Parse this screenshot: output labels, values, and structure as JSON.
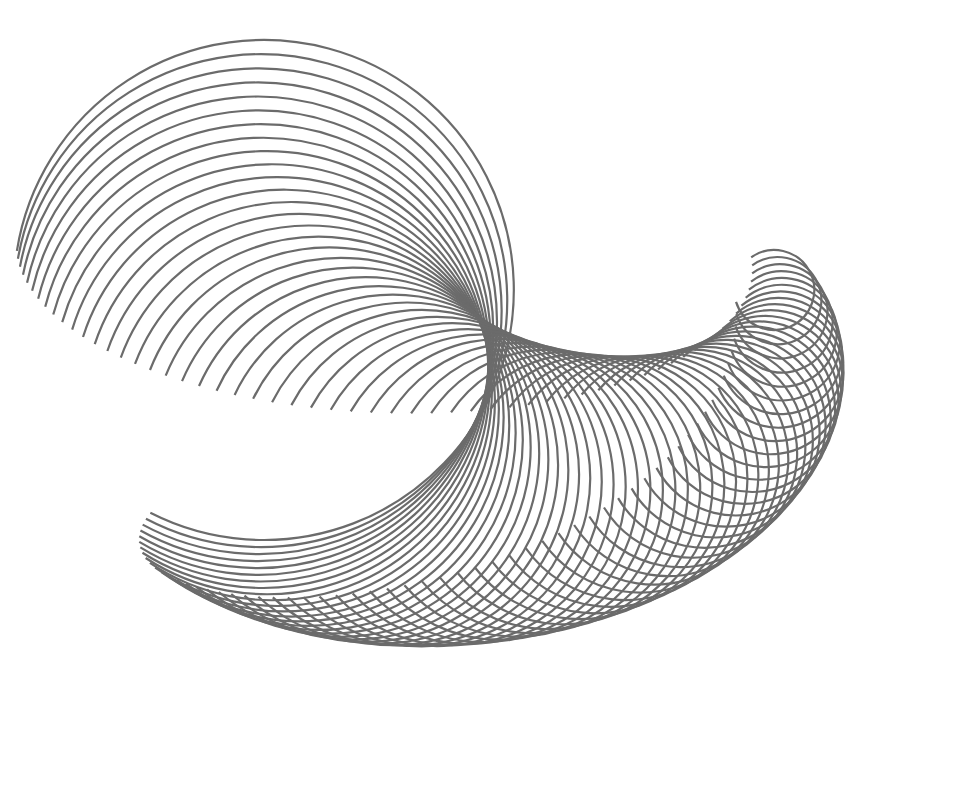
{
  "artwork": {
    "description": "Spirograph-like looping line art forming a crescent/spiral shape",
    "stroke_color": "#6b6b6b",
    "background": "#ffffff",
    "loops": 60
  }
}
